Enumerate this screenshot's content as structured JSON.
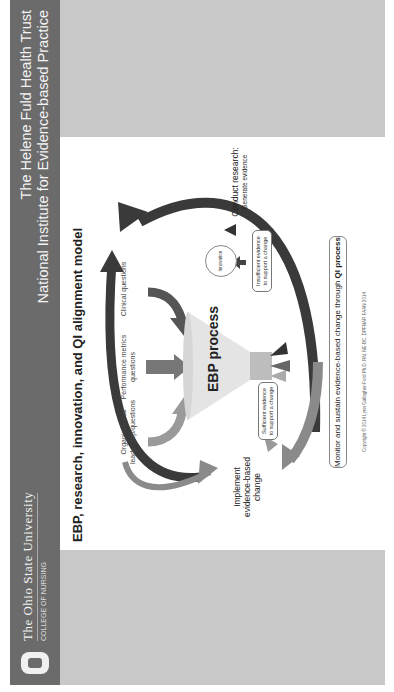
{
  "header": {
    "university": "The Ohio State University",
    "college": "COLLEGE OF NURSING",
    "trust_line1": "The Helene Fuld Health Trust",
    "trust_line2": "National Institute for Evidence-based Practice",
    "logo_icon": "block-o-icon"
  },
  "slide": {
    "title": "EBP, research, innovation, and QI alignment model",
    "inputs": [
      {
        "label_line1": "Organizational",
        "label_line2": "leadership/questions"
      },
      {
        "label_line1": "Performance metrics",
        "label_line2": "questions"
      },
      {
        "label_line1": "Clinical questions",
        "label_line2": ""
      }
    ],
    "funnel_label": "EBP process",
    "sufficient_box": {
      "line1": "Sufficient evidence",
      "line2": "to support a change"
    },
    "insufficient_box": {
      "line1": "Insufficient evidence",
      "line2": "to support a change"
    },
    "innovation_label": "Innovation",
    "implement": {
      "line1": "Implement",
      "line2": "evidence-based change"
    },
    "research": {
      "line1": "Conduct research:",
      "line2": "Generate evidence"
    },
    "monitor": {
      "prefix": "Monitor and sustain evidence-based change through ",
      "bold": "QI process"
    },
    "copyright": "Copyright © 2014 Lynn Gallagher-Ford Ph.D. RN, NE-BC, DPFNAP, FAAN 2014"
  },
  "colors": {
    "header_bg": "#6b6b6b",
    "side_blocks": "#c8c8c8",
    "dark_arrow": "#3a3a3a",
    "mid_arrow": "#707070",
    "light_arrow": "#9a9a9a",
    "funnel": "#e6e6e6"
  }
}
